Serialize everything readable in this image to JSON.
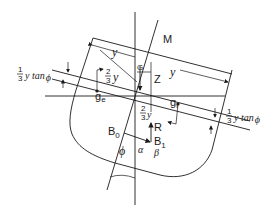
{
  "diagram": {
    "labels": {
      "M": "M",
      "G": "G",
      "Z": "Z",
      "R": "R",
      "B0": "B",
      "B0_sub": "0",
      "B1": "B",
      "B1_sub": "1",
      "ge": "g",
      "ge_sub": "e",
      "gi": "g",
      "gi_sub": "i",
      "y_left": "y",
      "y_right": "y",
      "two_thirds_y_left_num": "2",
      "two_thirds_y_left_den": "3",
      "two_thirds_y_left_var": "y",
      "two_thirds_y_center_num": "2",
      "two_thirds_y_center_den": "3",
      "two_thirds_y_center_var": "y",
      "tan_left_num": "1",
      "tan_left_den": "3",
      "tan_left_expr": "y tan",
      "tan_left_phi": "ϕ",
      "tan_right_num": "1",
      "tan_right_den": "3",
      "tan_right_expr": "y tan",
      "tan_right_phi": "ϕ",
      "phi": "ϕ",
      "alpha": "α",
      "beta": "β"
    }
  }
}
